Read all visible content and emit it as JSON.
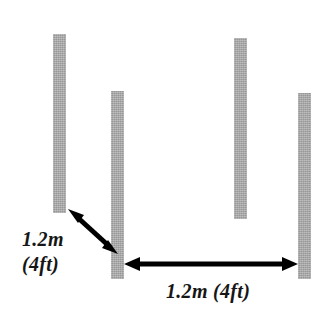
{
  "diagram": {
    "background_color": "#ffffff",
    "post_color": "#a6a6a6",
    "arrow_color": "#000000",
    "posts": [
      {
        "name": "post-1",
        "x": 53,
        "y": 34,
        "width": 13,
        "height": 179
      },
      {
        "name": "post-2",
        "x": 111,
        "y": 91,
        "width": 13,
        "height": 188
      },
      {
        "name": "post-3",
        "x": 234,
        "y": 38,
        "width": 13,
        "height": 181
      },
      {
        "name": "post-4",
        "x": 298,
        "y": 93,
        "width": 13,
        "height": 186
      }
    ],
    "arrows": [
      {
        "name": "diagonal-dimension-arrow",
        "x1": 70,
        "y1": 211,
        "x2": 116,
        "y2": 252,
        "double_headed": true
      },
      {
        "name": "horizontal-dimension-arrow",
        "x1": 125,
        "y1": 264,
        "x2": 297,
        "y2": 264,
        "double_headed": true
      }
    ],
    "labels": {
      "left_metric": "1.2m",
      "left_imperial": "(4ft)",
      "bottom": "1.2m (4ft)"
    }
  }
}
